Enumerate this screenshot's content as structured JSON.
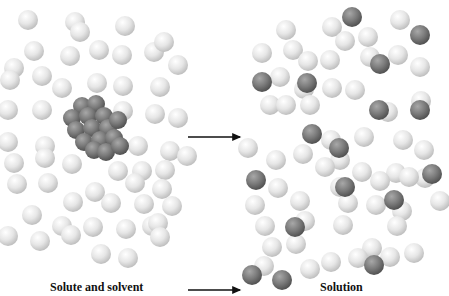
{
  "labels": {
    "left": "Solute and solvent",
    "right": "Solution"
  },
  "colors": {
    "solvent": "#dcdcdc",
    "solute": "#7a7a7a",
    "arrow": "#111111"
  },
  "left_panel": {
    "solvent": [
      [
        28,
        20
      ],
      [
        75,
        22
      ],
      [
        80,
        32
      ],
      [
        125,
        26
      ],
      [
        34,
        51
      ],
      [
        70,
        56
      ],
      [
        99,
        50
      ],
      [
        122,
        55
      ],
      [
        154,
        52
      ],
      [
        164,
        42
      ],
      [
        178,
        65
      ],
      [
        14,
        68
      ],
      [
        10,
        80
      ],
      [
        42,
        76
      ],
      [
        62,
        88
      ],
      [
        97,
        83
      ],
      [
        123,
        86
      ],
      [
        160,
        87
      ],
      [
        8,
        110
      ],
      [
        42,
        110
      ],
      [
        123,
        111
      ],
      [
        155,
        114
      ],
      [
        178,
        118
      ],
      [
        8,
        142
      ],
      [
        45,
        146
      ],
      [
        138,
        146
      ],
      [
        170,
        151
      ],
      [
        187,
        156
      ],
      [
        14,
        163
      ],
      [
        45,
        158
      ],
      [
        72,
        164
      ],
      [
        118,
        171
      ],
      [
        142,
        171
      ],
      [
        165,
        170
      ],
      [
        17,
        184
      ],
      [
        48,
        183
      ],
      [
        95,
        192
      ],
      [
        135,
        183
      ],
      [
        162,
        189
      ],
      [
        73,
        202
      ],
      [
        111,
        203
      ],
      [
        144,
        204
      ],
      [
        172,
        206
      ],
      [
        32,
        215
      ],
      [
        62,
        226
      ],
      [
        93,
        227
      ],
      [
        126,
        229
      ],
      [
        152,
        226
      ],
      [
        158,
        223
      ],
      [
        8,
        236
      ],
      [
        40,
        241
      ],
      [
        71,
        235
      ],
      [
        160,
        237
      ],
      [
        101,
        254
      ],
      [
        128,
        258
      ]
    ],
    "cluster": [
      [
        82,
        106
      ],
      [
        96,
        104
      ],
      [
        72,
        118
      ],
      [
        88,
        116
      ],
      [
        104,
        116
      ],
      [
        76,
        130
      ],
      [
        92,
        128
      ],
      [
        108,
        128
      ],
      [
        118,
        120
      ],
      [
        84,
        142
      ],
      [
        100,
        140
      ],
      [
        114,
        138
      ],
      [
        94,
        150
      ],
      [
        106,
        152
      ],
      [
        120,
        146
      ]
    ]
  },
  "right_panel": {
    "solvent": [
      [
        286,
        30
      ],
      [
        332,
        27
      ],
      [
        400,
        20
      ],
      [
        293,
        50
      ],
      [
        345,
        41
      ],
      [
        368,
        37
      ],
      [
        262,
        53
      ],
      [
        308,
        61
      ],
      [
        330,
        60
      ],
      [
        370,
        57
      ],
      [
        398,
        55
      ],
      [
        420,
        67
      ],
      [
        280,
        77
      ],
      [
        304,
        89
      ],
      [
        332,
        88
      ],
      [
        270,
        105
      ],
      [
        286,
        105
      ],
      [
        310,
        105
      ],
      [
        355,
        90
      ],
      [
        388,
        112
      ],
      [
        421,
        101
      ],
      [
        331,
        140
      ],
      [
        364,
        137
      ],
      [
        403,
        140
      ],
      [
        424,
        150
      ],
      [
        248,
        148
      ],
      [
        340,
        160
      ],
      [
        276,
        160
      ],
      [
        303,
        154
      ],
      [
        325,
        167
      ],
      [
        362,
        172
      ],
      [
        396,
        173
      ],
      [
        425,
        178
      ],
      [
        278,
        188
      ],
      [
        340,
        187
      ],
      [
        380,
        181
      ],
      [
        409,
        177
      ],
      [
        255,
        205
      ],
      [
        300,
        201
      ],
      [
        348,
        203
      ],
      [
        376,
        205
      ],
      [
        402,
        211
      ],
      [
        440,
        201
      ],
      [
        265,
        226
      ],
      [
        305,
        221
      ],
      [
        343,
        225
      ],
      [
        397,
        226
      ],
      [
        272,
        247
      ],
      [
        296,
        244
      ],
      [
        331,
        262
      ],
      [
        372,
        248
      ],
      [
        414,
        253
      ],
      [
        264,
        266
      ],
      [
        310,
        269
      ],
      [
        358,
        258
      ],
      [
        390,
        257
      ]
    ],
    "solute": [
      [
        352,
        17
      ],
      [
        420,
        35
      ],
      [
        380,
        64
      ],
      [
        262,
        82
      ],
      [
        307,
        83
      ],
      [
        379,
        110
      ],
      [
        420,
        110
      ],
      [
        312,
        134
      ],
      [
        339,
        148
      ],
      [
        256,
        180
      ],
      [
        345,
        187
      ],
      [
        394,
        200
      ],
      [
        432,
        174
      ],
      [
        295,
        227
      ],
      [
        374,
        265
      ],
      [
        252,
        275
      ],
      [
        282,
        280
      ]
    ]
  },
  "arrows": [
    {
      "x1": 188,
      "y1": 137,
      "x2": 240,
      "y2": 137
    },
    {
      "x1": 188,
      "y1": 290,
      "x2": 240,
      "y2": 290
    }
  ]
}
